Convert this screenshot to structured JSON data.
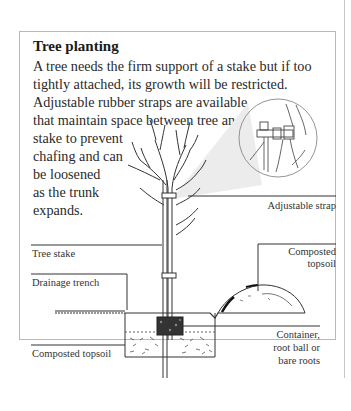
{
  "panel": {
    "title": "Tree planting",
    "body_lines": [
      "A tree needs the firm support of a stake but if too",
      "tightly attached, its growth will be restricted.",
      "Adjustable rubber straps are available",
      "that maintain space between tree and",
      "stake to prevent",
      "chafing and can",
      "be loosened",
      "as the trunk",
      "expands."
    ]
  },
  "diagram": {
    "labels": {
      "adjustable_strap": "Adjustable strap",
      "tree_stake": "Tree stake",
      "composted_topsoil_heap_line1": "Composted",
      "composted_topsoil_heap_line2": "topsoil",
      "drainage_trench": "Drainage trench",
      "container_line1": "Container,",
      "container_line2": "root ball or",
      "container_line3": "bare roots",
      "composted_topsoil_bottom": "Composted topsoil"
    },
    "icons": [
      "tree-illustration-icon",
      "strap-detail-magnifier-icon",
      "soil-heap-icon",
      "trench-cross-section-icon"
    ]
  }
}
